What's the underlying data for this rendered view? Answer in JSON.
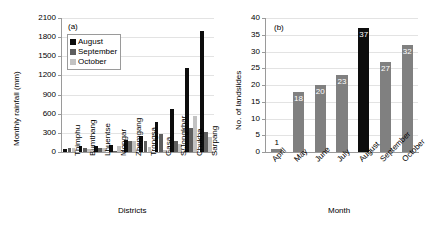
{
  "figure": {
    "panels": [
      "a",
      "b"
    ]
  },
  "chart_data": [
    {
      "type": "bar",
      "panel_tag": "(a)",
      "title": "",
      "xlabel": "Districts",
      "ylabel": "Monthly rainfall (mm)",
      "ylim": [
        0,
        2100
      ],
      "yticks": [
        0,
        300,
        600,
        900,
        1200,
        1500,
        1800,
        2100
      ],
      "ytick_labels": [
        "0",
        "300",
        "600",
        "900",
        "1200",
        "1500",
        "1800",
        "2100"
      ],
      "grid": true,
      "legend_position": "upper-left",
      "categories": [
        "Thimphu",
        "Bumthang",
        "Lhuentse",
        "Mongar",
        "Zhemgang",
        "Trongsa",
        "Gasa",
        "S/Jongkhar",
        "Chukha",
        "Sarpang"
      ],
      "series": [
        {
          "name": "August",
          "color": "#0d0d0d",
          "values": [
            55,
            95,
            100,
            110,
            185,
            250,
            475,
            670,
            1310,
            1900
          ]
        },
        {
          "name": "September",
          "color": "#5e5e5e",
          "values": [
            60,
            60,
            60,
            20,
            175,
            165,
            290,
            180,
            370,
            310
          ]
        },
        {
          "name": "October",
          "color": "#c2c2c2",
          "values": [
            60,
            55,
            60,
            95,
            175,
            85,
            30,
            120,
            570,
            235
          ]
        }
      ]
    },
    {
      "type": "bar",
      "panel_tag": "(b)",
      "title": "",
      "xlabel": "Month",
      "ylabel": "No. of landslides",
      "ylim": [
        0,
        40
      ],
      "yticks": [
        0,
        5,
        10,
        15,
        20,
        25,
        30,
        35,
        40
      ],
      "ytick_labels": [
        "0",
        "5",
        "10",
        "15",
        "20",
        "25",
        "30",
        "35",
        "40"
      ],
      "grid": true,
      "legend_position": "none",
      "categories": [
        "April",
        "May",
        "June",
        "July",
        "August",
        "September",
        "October"
      ],
      "values": [
        1,
        18,
        20,
        23,
        37,
        27,
        32
      ],
      "data_labels": [
        "1",
        "18",
        "20",
        "23",
        "37",
        "27",
        "32"
      ],
      "bar_colors": [
        "#808080",
        "#808080",
        "#808080",
        "#808080",
        "#0d0d0d",
        "#808080",
        "#808080"
      ],
      "highlight_category": "August"
    }
  ]
}
